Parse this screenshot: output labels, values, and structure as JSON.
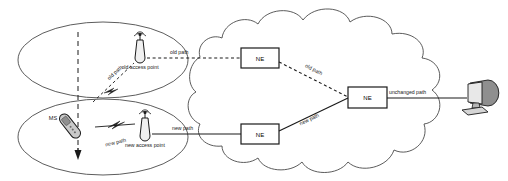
{
  "diagram": {
    "colors": {
      "stroke": "#3a3a3a",
      "line": "#000000",
      "text": "#1a1a1a",
      "device_fill": "#d8d8d8",
      "device_shade": "#9a9a9a",
      "background": "#ffffff"
    },
    "cells": {
      "old_cell_name": "old-cell-coverage-area",
      "new_cell_name": "new-cell-coverage-area"
    },
    "nodes": {
      "old_access_point": "old access point",
      "new_access_point": "new access point",
      "mobile_station": "MS",
      "ne_top": "NE",
      "ne_bottom": "NE",
      "ne_right": "NE",
      "terminal": "terminal-computer"
    },
    "paths": {
      "old_wireless": "old path",
      "old_backhaul": "old path",
      "old_core": "old path",
      "new_wireless": "new path",
      "new_backhaul": "new path",
      "new_core": "new path",
      "unchanged": "unchanged path"
    },
    "movement": {
      "direction_arrow": "downward-movement-arrow"
    }
  }
}
